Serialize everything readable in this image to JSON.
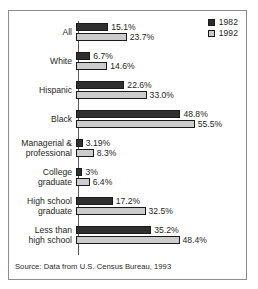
{
  "chart_data": {
    "type": "bar",
    "orientation": "horizontal",
    "title": "",
    "xlabel": "",
    "ylabel": "",
    "grid": false,
    "legend_position": "top-right",
    "xlim": [
      0,
      60
    ],
    "categories": [
      "All",
      "White",
      "Hispanic",
      "Black",
      "Managerial & professional",
      "College graduate",
      "High school graduate",
      "Less than high school"
    ],
    "category_lines": [
      [
        "All"
      ],
      [
        "White"
      ],
      [
        "Hispanic"
      ],
      [
        "Black"
      ],
      [
        "Managerial &",
        "professional"
      ],
      [
        "College",
        "graduate"
      ],
      [
        "High school",
        "graduate"
      ],
      [
        "Less than",
        "high school"
      ]
    ],
    "series": [
      {
        "name": "1982",
        "color": "#2f2f2f",
        "values": [
          15.1,
          6.7,
          22.6,
          48.8,
          3.19,
          3,
          17.2,
          35.2
        ],
        "labels": [
          "15.1%",
          "6.7%",
          "22.6%",
          "48.8%",
          "3.19%",
          "3%",
          "17.2%",
          "35.2%"
        ]
      },
      {
        "name": "1992",
        "color": "#cccccc",
        "values": [
          23.7,
          14.6,
          33.0,
          55.5,
          8.3,
          6.4,
          32.5,
          48.4
        ],
        "labels": [
          "23.7%",
          "14.6%",
          "33.0%",
          "55.5%",
          "8.3%",
          "6.4%",
          "32.5%",
          "48.4%"
        ]
      }
    ],
    "source": "Source: Data from U.S. Census Bureau, 1993"
  },
  "legend": {
    "items": [
      {
        "label": "1982",
        "swatch": "dark"
      },
      {
        "label": "1992",
        "swatch": "light"
      }
    ]
  },
  "colors": {
    "series_1982": "#2f2f2f",
    "series_1992": "#cccccc",
    "axis": "#58595b",
    "frame": "#8d8d8d",
    "text": "#231f20"
  }
}
